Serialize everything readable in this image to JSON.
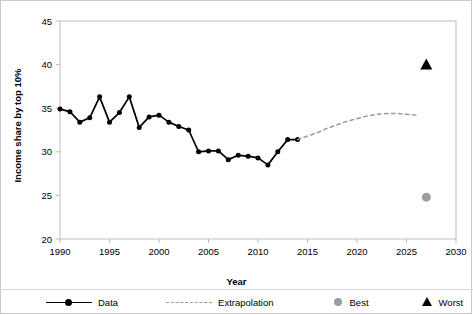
{
  "chart_data": {
    "type": "line",
    "title": "",
    "xlabel": "Year",
    "ylabel": "Income share by top 10%",
    "xlim": [
      1990,
      2030
    ],
    "ylim": [
      20,
      45
    ],
    "xticks": [
      1990,
      1995,
      2000,
      2005,
      2010,
      2015,
      2020,
      2025,
      2030
    ],
    "yticks": [
      20,
      25,
      30,
      35,
      40,
      45
    ],
    "grid": false,
    "legend_position": "bottom",
    "series": [
      {
        "name": "Data",
        "type": "line-marker",
        "color": "#000000",
        "x": [
          1990,
          1991,
          1992,
          1993,
          1994,
          1995,
          1996,
          1997,
          1998,
          1999,
          2000,
          2001,
          2002,
          2003,
          2004,
          2005,
          2006,
          2007,
          2008,
          2009,
          2010,
          2011,
          2012,
          2013,
          2014
        ],
        "values": [
          34.9,
          34.6,
          33.4,
          33.9,
          36.3,
          33.4,
          34.5,
          36.3,
          32.8,
          34.0,
          34.2,
          33.4,
          32.9,
          32.5,
          30.0,
          30.1,
          30.1,
          29.1,
          29.6,
          29.5,
          29.3,
          28.5,
          30.0,
          31.4,
          31.4
        ]
      },
      {
        "name": "Extrapolation",
        "type": "dashed-line",
        "color": "#9a9a9a",
        "x": [
          2014,
          2015,
          2016,
          2017,
          2018,
          2019,
          2020,
          2021,
          2022,
          2023,
          2024,
          2025,
          2026
        ],
        "values": [
          31.4,
          31.8,
          32.2,
          32.7,
          33.1,
          33.5,
          33.8,
          34.1,
          34.3,
          34.4,
          34.4,
          34.3,
          34.2
        ]
      },
      {
        "name": "Best",
        "type": "point-circle",
        "color": "#9e9e9e",
        "x": [
          2027
        ],
        "values": [
          24.8
        ]
      },
      {
        "name": "Worst",
        "type": "point-triangle",
        "color": "#000000",
        "x": [
          2027
        ],
        "values": [
          40.0
        ]
      }
    ]
  },
  "legend": {
    "data_label": "Data",
    "extrapolation_label": "Extrapolation",
    "best_label": "Best",
    "worst_label": "Worst"
  },
  "axes": {
    "x_title": "Year",
    "y_title": "Income share by top 10%"
  },
  "colors": {
    "data": "#000000",
    "extrapolation": "#9a9a9a",
    "best": "#9e9e9e",
    "worst": "#000000",
    "axis": "#bdbdbd",
    "frame": "#c8c8c8"
  }
}
